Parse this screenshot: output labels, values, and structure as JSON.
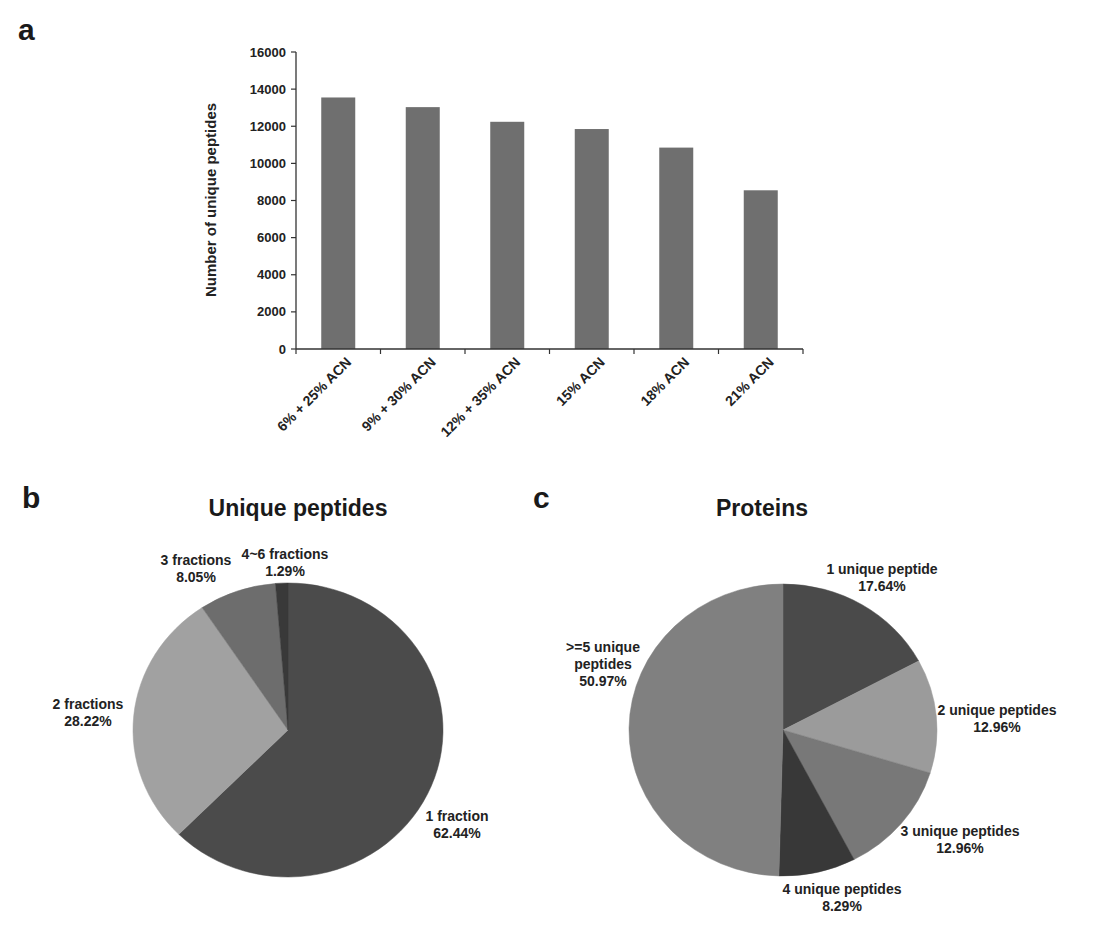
{
  "figure": {
    "panel_a_letter": "a",
    "panel_b_letter": "b",
    "panel_c_letter": "c"
  },
  "chart_data": [
    {
      "type": "bar",
      "panel": "a",
      "title": "",
      "xlabel": "",
      "ylabel": "Number of unique peptides",
      "ylim": [
        0,
        16000
      ],
      "yticks": [
        0,
        2000,
        4000,
        6000,
        8000,
        10000,
        12000,
        14000,
        16000
      ],
      "grid": false,
      "legend": null,
      "categories": [
        "6% + 25% ACN",
        "9% + 30% ACN",
        "12% + 35% ACN",
        "15% ACN",
        "18% ACN",
        "21% ACN"
      ],
      "values": [
        13550,
        13030,
        12240,
        11850,
        10850,
        8550
      ],
      "bar_color": "#6f6f6f"
    },
    {
      "type": "pie",
      "panel": "b",
      "title": "Unique peptides",
      "slices": [
        {
          "label": "1 fraction",
          "value": 62.44,
          "display": "62.44%",
          "color": "#4b4b4b"
        },
        {
          "label": "2 fractions",
          "value": 28.22,
          "display": "28.22%",
          "color": "#a1a1a1"
        },
        {
          "label": "3 fractions",
          "value": 8.05,
          "display": "8.05%",
          "color": "#6d6d6d"
        },
        {
          "label": "4~6 fractions",
          "value": 1.29,
          "display": "1.29%",
          "color": "#393939"
        }
      ]
    },
    {
      "type": "pie",
      "panel": "c",
      "title": "Proteins",
      "slices": [
        {
          "label": "1 unique peptide",
          "value": 17.64,
          "display": "17.64%",
          "color": "#4a4a4a"
        },
        {
          "label": "2 unique peptides",
          "value": 12.96,
          "display": "12.96%",
          "color": "#9b9b9b"
        },
        {
          "label": "3 unique peptides",
          "value": 12.96,
          "display": "12.96%",
          "color": "#787878"
        },
        {
          "label": "4 unique peptides",
          "value": 8.29,
          "display": "8.29%",
          "color": "#383838"
        },
        {
          "label": ">=5 unique peptides",
          "value": 50.97,
          "display": "50.97%",
          "color": "#808080"
        }
      ]
    }
  ]
}
